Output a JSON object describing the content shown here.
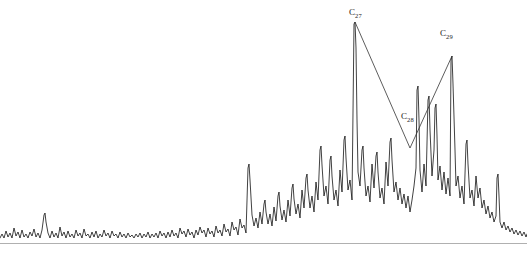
{
  "figure": {
    "background_color": "#ffffff",
    "trace_color": "#111111",
    "axis_color": "#b0b0b0",
    "annotation_color": "#333333",
    "width": 527,
    "height": 261
  },
  "annotations": [
    {
      "name": "c27",
      "text": "C",
      "subscript": "27",
      "x": 349,
      "y": 8
    },
    {
      "name": "c28",
      "text": "C",
      "subscript": "28",
      "x": 401,
      "y": 112
    },
    {
      "name": "c29",
      "text": "C",
      "subscript": "29",
      "x": 440,
      "y": 29
    }
  ],
  "chart_data": {
    "type": "line",
    "title": "",
    "xlabel": "",
    "ylabel": "",
    "xlim": [
      0,
      527
    ],
    "ylim": [
      0,
      243
    ],
    "grid": false,
    "legend": null,
    "baseline_y": 243,
    "axis_line": {
      "x1": 0,
      "x2": 527,
      "y": 243
    },
    "series": [
      {
        "name": "total-ion-chromatogram",
        "color": "#111111",
        "points": [
          [
            0,
            238
          ],
          [
            2,
            234
          ],
          [
            4,
            238
          ],
          [
            6,
            231
          ],
          [
            8,
            237
          ],
          [
            10,
            233
          ],
          [
            12,
            238
          ],
          [
            14,
            228
          ],
          [
            16,
            236
          ],
          [
            18,
            232
          ],
          [
            20,
            238
          ],
          [
            22,
            230
          ],
          [
            24,
            237
          ],
          [
            26,
            234
          ],
          [
            28,
            238
          ],
          [
            30,
            232
          ],
          [
            32,
            236
          ],
          [
            34,
            229
          ],
          [
            36,
            237
          ],
          [
            38,
            233
          ],
          [
            40,
            238
          ],
          [
            42,
            230
          ],
          [
            44,
            215
          ],
          [
            45,
            213
          ],
          [
            46,
            222
          ],
          [
            48,
            233
          ],
          [
            50,
            238
          ],
          [
            52,
            231
          ],
          [
            54,
            237
          ],
          [
            56,
            233
          ],
          [
            58,
            238
          ],
          [
            60,
            227
          ],
          [
            62,
            236
          ],
          [
            64,
            232
          ],
          [
            66,
            238
          ],
          [
            68,
            231
          ],
          [
            70,
            237
          ],
          [
            72,
            234
          ],
          [
            74,
            238
          ],
          [
            76,
            230
          ],
          [
            78,
            236
          ],
          [
            80,
            233
          ],
          [
            82,
            238
          ],
          [
            84,
            229
          ],
          [
            86,
            236
          ],
          [
            88,
            234
          ],
          [
            90,
            238
          ],
          [
            92,
            232
          ],
          [
            94,
            237
          ],
          [
            96,
            231
          ],
          [
            98,
            238
          ],
          [
            100,
            234
          ],
          [
            102,
            237
          ],
          [
            104,
            230
          ],
          [
            106,
            236
          ],
          [
            108,
            233
          ],
          [
            110,
            238
          ],
          [
            112,
            231
          ],
          [
            114,
            236
          ],
          [
            116,
            234
          ],
          [
            118,
            238
          ],
          [
            120,
            232
          ],
          [
            122,
            237
          ],
          [
            124,
            234
          ],
          [
            126,
            238
          ],
          [
            128,
            233
          ],
          [
            130,
            237
          ],
          [
            132,
            235
          ],
          [
            134,
            238
          ],
          [
            136,
            234
          ],
          [
            138,
            237
          ],
          [
            140,
            233
          ],
          [
            142,
            238
          ],
          [
            144,
            234
          ],
          [
            146,
            237
          ],
          [
            148,
            232
          ],
          [
            150,
            238
          ],
          [
            152,
            234
          ],
          [
            154,
            237
          ],
          [
            156,
            233
          ],
          [
            158,
            238
          ],
          [
            160,
            231
          ],
          [
            162,
            236
          ],
          [
            164,
            233
          ],
          [
            166,
            238
          ],
          [
            168,
            232
          ],
          [
            170,
            237
          ],
          [
            172,
            230
          ],
          [
            174,
            236
          ],
          [
            176,
            233
          ],
          [
            178,
            238
          ],
          [
            180,
            228
          ],
          [
            182,
            234
          ],
          [
            184,
            231
          ],
          [
            186,
            237
          ],
          [
            188,
            229
          ],
          [
            190,
            235
          ],
          [
            192,
            232
          ],
          [
            194,
            238
          ],
          [
            196,
            230
          ],
          [
            198,
            235
          ],
          [
            200,
            227
          ],
          [
            202,
            233
          ],
          [
            204,
            230
          ],
          [
            206,
            237
          ],
          [
            208,
            228
          ],
          [
            210,
            234
          ],
          [
            212,
            231
          ],
          [
            214,
            237
          ],
          [
            216,
            226
          ],
          [
            218,
            233
          ],
          [
            220,
            230
          ],
          [
            222,
            236
          ],
          [
            224,
            224
          ],
          [
            226,
            232
          ],
          [
            228,
            229
          ],
          [
            230,
            236
          ],
          [
            232,
            222
          ],
          [
            234,
            230
          ],
          [
            236,
            227
          ],
          [
            238,
            235
          ],
          [
            240,
            219
          ],
          [
            242,
            228
          ],
          [
            244,
            225
          ],
          [
            246,
            233
          ],
          [
            248,
            168
          ],
          [
            249,
            164
          ],
          [
            250,
            180
          ],
          [
            252,
            215
          ],
          [
            254,
            226
          ],
          [
            256,
            218
          ],
          [
            258,
            228
          ],
          [
            260,
            212
          ],
          [
            262,
            224
          ],
          [
            264,
            204
          ],
          [
            265,
            200
          ],
          [
            266,
            212
          ],
          [
            268,
            224
          ],
          [
            270,
            214
          ],
          [
            272,
            226
          ],
          [
            274,
            207
          ],
          [
            276,
            221
          ],
          [
            278,
            196
          ],
          [
            279,
            192
          ],
          [
            280,
            206
          ],
          [
            282,
            220
          ],
          [
            284,
            210
          ],
          [
            286,
            222
          ],
          [
            288,
            200
          ],
          [
            290,
            216
          ],
          [
            292,
            188
          ],
          [
            293,
            184
          ],
          [
            294,
            199
          ],
          [
            296,
            214
          ],
          [
            298,
            204
          ],
          [
            300,
            218
          ],
          [
            302,
            190
          ],
          [
            304,
            208
          ],
          [
            306,
            178
          ],
          [
            307,
            174
          ],
          [
            308,
            190
          ],
          [
            310,
            208
          ],
          [
            312,
            196
          ],
          [
            314,
            212
          ],
          [
            316,
            182
          ],
          [
            318,
            200
          ],
          [
            320,
            150
          ],
          [
            321,
            146
          ],
          [
            322,
            165
          ],
          [
            324,
            196
          ],
          [
            326,
            186
          ],
          [
            328,
            204
          ],
          [
            330,
            160
          ],
          [
            331,
            156
          ],
          [
            332,
            176
          ],
          [
            334,
            200
          ],
          [
            336,
            190
          ],
          [
            338,
            206
          ],
          [
            340,
            170
          ],
          [
            342,
            192
          ],
          [
            344,
            140
          ],
          [
            345,
            136
          ],
          [
            346,
            158
          ],
          [
            348,
            190
          ],
          [
            350,
            180
          ],
          [
            352,
            200
          ],
          [
            354,
            24
          ],
          [
            355,
            22
          ],
          [
            356,
            48
          ],
          [
            357,
            120
          ],
          [
            358,
            172
          ],
          [
            360,
            186
          ],
          [
            362,
            150
          ],
          [
            363,
            146
          ],
          [
            364,
            168
          ],
          [
            366,
            196
          ],
          [
            368,
            186
          ],
          [
            370,
            202
          ],
          [
            372,
            164
          ],
          [
            374,
            188
          ],
          [
            376,
            156
          ],
          [
            377,
            152
          ],
          [
            378,
            172
          ],
          [
            380,
            198
          ],
          [
            382,
            188
          ],
          [
            384,
            204
          ],
          [
            386,
            162
          ],
          [
            388,
            186
          ],
          [
            390,
            142
          ],
          [
            391,
            138
          ],
          [
            392,
            160
          ],
          [
            394,
            192
          ],
          [
            396,
            182
          ],
          [
            398,
            200
          ],
          [
            400,
            188
          ],
          [
            402,
            204
          ],
          [
            404,
            194
          ],
          [
            406,
            208
          ],
          [
            408,
            196
          ],
          [
            410,
            212
          ],
          [
            412,
            200
          ],
          [
            414,
            186
          ],
          [
            416,
            168
          ],
          [
            417,
            90
          ],
          [
            418,
            86
          ],
          [
            419,
            120
          ],
          [
            420,
            170
          ],
          [
            422,
            192
          ],
          [
            424,
            164
          ],
          [
            426,
            186
          ],
          [
            428,
            100
          ],
          [
            429,
            96
          ],
          [
            430,
            130
          ],
          [
            432,
            176
          ],
          [
            434,
            150
          ],
          [
            435,
            108
          ],
          [
            436,
            104
          ],
          [
            437,
            136
          ],
          [
            438,
            180
          ],
          [
            440,
            166
          ],
          [
            442,
            190
          ],
          [
            444,
            172
          ],
          [
            446,
            194
          ],
          [
            448,
            178
          ],
          [
            450,
            196
          ],
          [
            451,
            60
          ],
          [
            452,
            56
          ],
          [
            453,
            84
          ],
          [
            455,
            150
          ],
          [
            456,
            186
          ],
          [
            458,
            176
          ],
          [
            460,
            198
          ],
          [
            462,
            186
          ],
          [
            464,
            204
          ],
          [
            466,
            144
          ],
          [
            467,
            140
          ],
          [
            468,
            164
          ],
          [
            470,
            198
          ],
          [
            472,
            190
          ],
          [
            474,
            206
          ],
          [
            476,
            176
          ],
          [
            478,
            198
          ],
          [
            480,
            188
          ],
          [
            482,
            208
          ],
          [
            484,
            200
          ],
          [
            486,
            214
          ],
          [
            488,
            206
          ],
          [
            490,
            218
          ],
          [
            492,
            212
          ],
          [
            494,
            222
          ],
          [
            496,
            216
          ],
          [
            497,
            178
          ],
          [
            498,
            174
          ],
          [
            499,
            196
          ],
          [
            500,
            222
          ],
          [
            502,
            228
          ],
          [
            504,
            222
          ],
          [
            506,
            230
          ],
          [
            508,
            226
          ],
          [
            510,
            232
          ],
          [
            512,
            228
          ],
          [
            514,
            234
          ],
          [
            516,
            230
          ],
          [
            518,
            235
          ],
          [
            520,
            231
          ],
          [
            522,
            236
          ],
          [
            524,
            232
          ],
          [
            526,
            237
          ],
          [
            527,
            234
          ]
        ]
      }
    ],
    "annotation_polyline": {
      "name": "c27-c28-c29-connector",
      "color": "#333333",
      "points": [
        [
          355,
          22
        ],
        [
          410,
          148
        ],
        [
          452,
          56
        ]
      ]
    },
    "labeled_peaks": [
      {
        "label": "C27",
        "x": 355,
        "apex_y": 22,
        "note": "n-alkane C27"
      },
      {
        "label": "C28",
        "x": 410,
        "apex_y": 148,
        "note": "n-alkane C28 (valley of connector)"
      },
      {
        "label": "C29",
        "x": 452,
        "apex_y": 56,
        "note": "n-alkane C29"
      }
    ]
  }
}
